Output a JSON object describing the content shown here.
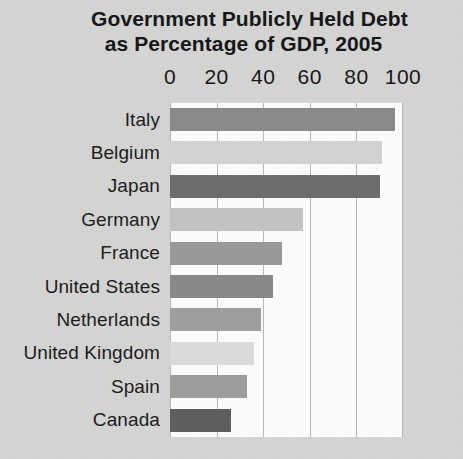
{
  "chart_data": {
    "type": "bar",
    "orientation": "horizontal",
    "title": "Government Publicly Held Debt as Percentage of GDP, 2005",
    "title_lines": [
      "Government Publicly Held Debt",
      "as Percentage of GDP, 2005"
    ],
    "xlabel": "",
    "ylabel": "",
    "xlim": [
      0,
      100
    ],
    "xticks": [
      0,
      20,
      40,
      60,
      80,
      100
    ],
    "xtick_labels": [
      "0",
      "20",
      "40",
      "60",
      "80",
      "100"
    ],
    "grid": true,
    "legend": "none",
    "categories": [
      "Italy",
      "Belgium",
      "Japan",
      "Germany",
      "France",
      "United States",
      "Netherlands",
      "United Kingdom",
      "Spain",
      "Canada"
    ],
    "values": [
      96.5,
      91,
      90,
      57,
      48,
      44,
      39,
      36,
      33,
      26
    ],
    "bar_colors": [
      "#8c8c8c",
      "#d3d3d3",
      "#6e6e6e",
      "#c4c4c4",
      "#9a9a9a",
      "#8a8a8a",
      "#a0a0a0",
      "#dcdcdc",
      "#9e9e9e",
      "#5f5f5f"
    ]
  },
  "style": {
    "page_background": "#d5d5d3",
    "plot_background": "#fdfdfd",
    "gridline_color": "#b9b9b7",
    "text_color": "#17181a"
  }
}
